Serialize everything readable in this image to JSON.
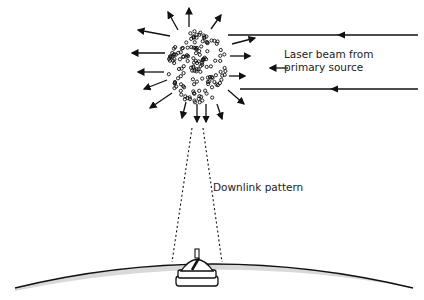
{
  "diagram": {
    "labels": {
      "laser_beam_line1": "Laser beam from",
      "laser_beam_line2": "primary source",
      "downlink": "Downlink pattern"
    },
    "colors": {
      "ink": "#111111",
      "earth_band": "#d9d9d9",
      "background": "#ffffff"
    },
    "elements": [
      "particle-cloud",
      "scatter-arrows",
      "laser-beams",
      "downlink-cone",
      "earth-surface",
      "ground-station"
    ]
  }
}
